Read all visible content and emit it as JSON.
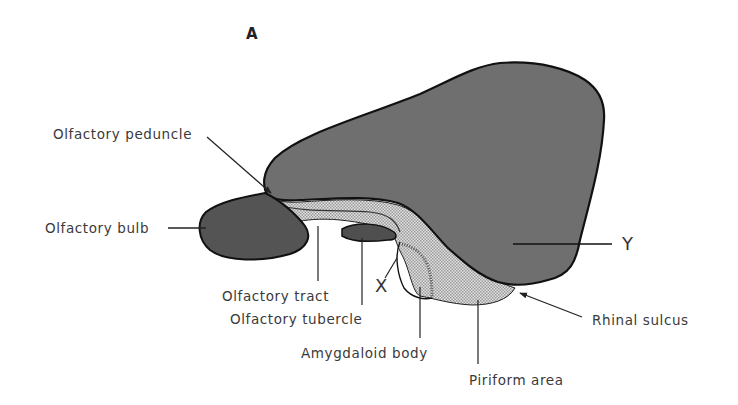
{
  "figure": {
    "panel_label": "A",
    "colors": {
      "cortex": "#6f6f6f",
      "olfactory_bulb": "#545454",
      "olfactory_tubercle": "#4f4f4f",
      "stippled_region": "#cfcfcf",
      "outline": "#111111",
      "label_text": "#3a3a3a",
      "background": "#ffffff"
    }
  },
  "labels": {
    "olfactory_peduncle": "Olfactory peduncle",
    "olfactory_bulb": "Olfactory bulb",
    "olfactory_tract": "Olfactory tract",
    "olfactory_tubercle": "Olfactory tubercle",
    "amygdaloid_body": "Amygdaloid body",
    "piriform_area": "Piriform area",
    "rhinal_sulcus": "Rhinal sulcus",
    "x_marker": "X",
    "y_marker": "Y"
  }
}
